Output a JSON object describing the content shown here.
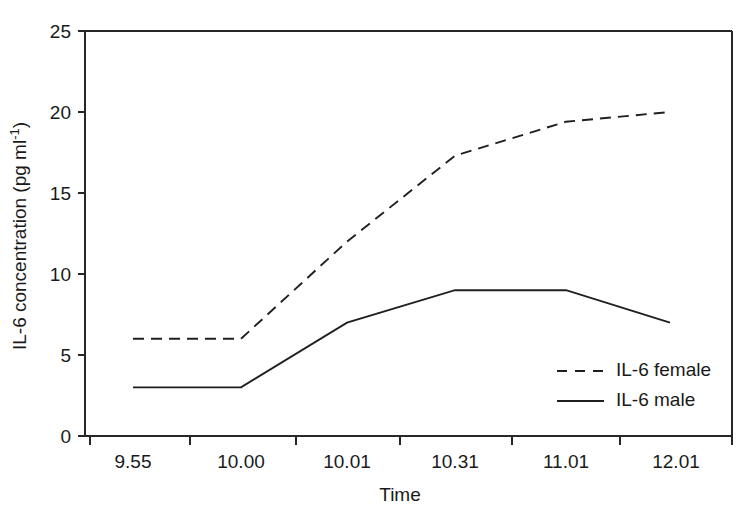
{
  "chart_data": {
    "type": "line",
    "title": "",
    "xlabel": "Time",
    "ylabel": "IL-6 concentration (pg ml⁻¹)",
    "ylabel_parts": {
      "main": "IL-6 concentration (pg ml",
      "superscript": "-1",
      "tail": ")"
    },
    "categories": [
      "9.55",
      "10.00",
      "10.01",
      "10.31",
      "11.01",
      "12.01"
    ],
    "xtick_labels": [
      "9.55",
      "10.00",
      "10.01",
      "10.31",
      "11.01",
      "12.01"
    ],
    "ytick_labels": [
      "0",
      "5",
      "10",
      "15",
      "20",
      "25"
    ],
    "ytick_values": [
      0,
      5,
      10,
      15,
      20,
      25
    ],
    "ylim": [
      0,
      25
    ],
    "grid": false,
    "legend_position": "lower right inside",
    "series": [
      {
        "name": "IL-6 female",
        "style": "dashed",
        "color": "#1f1f1f",
        "values": [
          6,
          6,
          12,
          17.3,
          19.4,
          20
        ]
      },
      {
        "name": "IL-6 male",
        "style": "solid",
        "color": "#1f1f1f",
        "values": [
          3,
          3,
          7,
          9,
          9,
          7
        ]
      }
    ],
    "legend_entries": [
      {
        "label": "IL-6 female",
        "style": "dashed"
      },
      {
        "label": "IL-6 male",
        "style": "solid"
      }
    ]
  },
  "axis": {
    "x_title": "Time",
    "y_tick_0": "0",
    "y_tick_5": "5",
    "y_tick_10": "10",
    "y_tick_15": "15",
    "y_tick_20": "20",
    "y_tick_25": "25",
    "x_tick_0": "9.55",
    "x_tick_1": "10.00",
    "x_tick_2": "10.01",
    "x_tick_3": "10.31",
    "x_tick_4": "11.01",
    "x_tick_5": "12.01"
  },
  "legend": {
    "entry_female": "IL-6 female",
    "entry_male": "IL-6 male"
  },
  "colors": {
    "line": "#1f1f1f",
    "axis": "#262626",
    "background": "#ffffff",
    "text": "#1a1a1a"
  }
}
